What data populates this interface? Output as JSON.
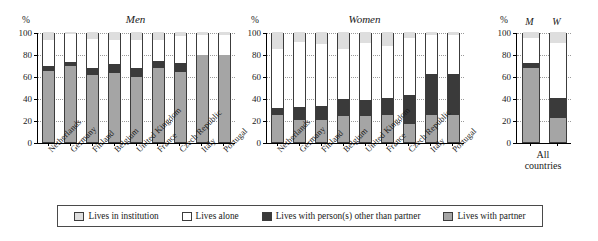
{
  "chart_data": {
    "type": "bar",
    "subtype": "stacked-percentage",
    "ylabel": "%",
    "ylim": [
      0,
      100
    ],
    "yticks": [
      0,
      20,
      40,
      60,
      80,
      100
    ],
    "grid": true,
    "legend_position": "bottom",
    "series": [
      {
        "name": "Lives in institution",
        "key": "inst",
        "color": "#dedede"
      },
      {
        "name": "Lives alone",
        "key": "alone",
        "color": "#ffffff"
      },
      {
        "name": "Lives with person(s) other than partner",
        "key": "other",
        "color": "#3a3a3a"
      },
      {
        "name": "Lives with partner",
        "key": "partner",
        "color": "#a5a5a5"
      }
    ],
    "panels": [
      {
        "title": "Men",
        "ylabel": "%",
        "categories": [
          "Netherlands",
          "Germany",
          "Finland",
          "Belgium",
          "United Kingdom",
          "France",
          "Czech Republic",
          "Italy",
          "Portugal"
        ],
        "values": {
          "partner": [
            65,
            69,
            61,
            63,
            59,
            67,
            64,
            79,
            79
          ],
          "other": [
            4,
            4,
            6,
            8,
            8,
            7,
            8,
            0,
            0
          ],
          "alone": [
            24,
            25,
            27,
            22,
            26,
            19,
            24,
            18,
            18
          ],
          "inst": [
            7,
            2,
            6,
            7,
            7,
            7,
            4,
            3,
            3
          ]
        }
      },
      {
        "title": "Women",
        "ylabel": "%",
        "categories": [
          "Netherlands",
          "Germany",
          "Finland",
          "Belgium",
          "United Kingdom",
          "France",
          "Czech Republic",
          "Italy",
          "Portugal"
        ],
        "values": {
          "partner": [
            25,
            20,
            20,
            24,
            24,
            25,
            16,
            25,
            25
          ],
          "other": [
            6,
            12,
            13,
            15,
            14,
            15,
            27,
            37,
            37
          ],
          "alone": [
            54,
            59,
            56,
            46,
            52,
            47,
            52,
            35,
            35
          ],
          "inst": [
            15,
            9,
            11,
            15,
            10,
            13,
            5,
            3,
            3
          ]
        }
      },
      {
        "title": "",
        "ylabel": "%",
        "group_label_line1": "All",
        "group_label_line2": "countries",
        "categories": [
          "M",
          "W"
        ],
        "values": {
          "partner": [
            67,
            22
          ],
          "other": [
            5,
            18
          ],
          "alone": [
            23,
            50
          ],
          "inst": [
            5,
            10
          ]
        }
      }
    ]
  },
  "legend": {
    "items": [
      {
        "label": "Lives in institution",
        "swatch": "sw-inst"
      },
      {
        "label": "Lives alone",
        "swatch": "sw-alone"
      },
      {
        "label": "Lives with person(s) other than partner",
        "swatch": "sw-other"
      },
      {
        "label": "Lives with partner",
        "swatch": "sw-partner"
      }
    ]
  }
}
